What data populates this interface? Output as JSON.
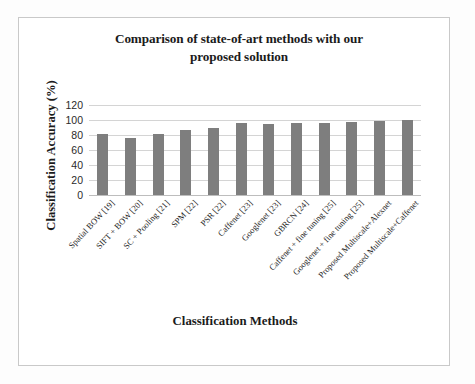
{
  "chart_data": {
    "type": "bar",
    "title": "Comparison of state-of-art methods with our proposed solution",
    "title_line1": "Comparison of state-of-art methods with our",
    "title_line2": "proposed solution",
    "xlabel": "Classification Methods",
    "ylabel": "Classification Accuracy (%)",
    "ylim": [
      0,
      120
    ],
    "yticks": [
      0,
      20,
      40,
      60,
      80,
      100,
      120
    ],
    "grid": true,
    "legend": false,
    "bar_color": "#7e7e7e",
    "categories": [
      "Spatial BOW [19]",
      "SIFT + BOW [20]",
      "SC + Pooling [21]",
      "SPM [22]",
      "PSR [22]",
      "Caffenet [23]",
      "Googlenet [23]",
      "GBRCN [24]",
      "Caffenet + fine tuning [25]",
      "Googlenet + fine tuning [25]",
      "Proposed Multiscale+Alexnet",
      "Proposed Multiscale+Caffenet"
    ],
    "values": [
      81,
      76,
      82,
      87,
      89,
      95.5,
      95,
      95.5,
      96.5,
      97.5,
      99,
      99.5
    ]
  }
}
